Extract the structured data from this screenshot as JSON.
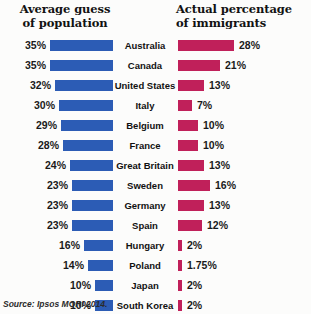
{
  "headers": {
    "left_line1": "Average guess",
    "left_line2": "of population",
    "right_line1": "Actual percentage",
    "right_line2": "of immigrants"
  },
  "source": "Source: Ipsos MORI 2014.",
  "colors": {
    "guess_bar": "#2c5cb5",
    "actual_bar": "#c0205a",
    "background": "#fcfcfb",
    "text": "#111111"
  },
  "chart_data": {
    "type": "bar",
    "xlabel": "",
    "ylabel": "",
    "orientation": "horizontal",
    "layout": "diverging-paired",
    "grid": false,
    "legend_position": "none",
    "categories": [
      "Australia",
      "Canada",
      "United States",
      "Italy",
      "Belgium",
      "France",
      "Great Britain",
      "Sweden",
      "Germany",
      "Spain",
      "Hungary",
      "Poland",
      "Japan",
      "South Korea"
    ],
    "series": [
      {
        "name": "Average guess of population",
        "align": "right",
        "color": "#2c5cb5",
        "values": [
          35,
          35,
          32,
          30,
          29,
          28,
          24,
          23,
          23,
          23,
          16,
          14,
          10,
          10
        ],
        "labels": [
          "35%",
          "35%",
          "32%",
          "30%",
          "29%",
          "28%",
          "24%",
          "23%",
          "23%",
          "23%",
          "16%",
          "14%",
          "10%",
          "10%"
        ]
      },
      {
        "name": "Actual percentage of immigrants",
        "align": "left",
        "color": "#c0205a",
        "values": [
          28,
          21,
          13,
          7,
          10,
          10,
          13,
          16,
          13,
          12,
          2,
          1.75,
          2,
          2
        ],
        "labels": [
          "28%",
          "21%",
          "13%",
          "7%",
          "10%",
          "10%",
          "13%",
          "16%",
          "13%",
          "12%",
          "2%",
          "1.75%",
          "2%",
          "2%"
        ]
      }
    ],
    "xlim_guess": [
      0,
      35
    ],
    "xlim_actual": [
      0,
      28
    ]
  }
}
